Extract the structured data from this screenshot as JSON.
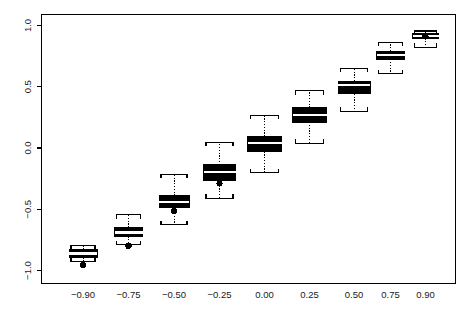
{
  "chart_data": {
    "type": "box",
    "title": "",
    "xlabel": "",
    "ylabel": "",
    "grid": false,
    "legend": null,
    "categories": [
      "-0.90",
      "-0.75",
      "-0.50",
      "-0.25",
      "0.00",
      "0.25",
      "0.50",
      "0.75",
      "0.90"
    ],
    "x_tick_labels": [
      "−0.90",
      "−0.75",
      "−0.50",
      "−0.25",
      "0.00",
      "0.25",
      "0.50",
      "0.75",
      "0.90"
    ],
    "y_tick_labels": [
      "1.0",
      "0.5",
      "0.0",
      "−0.5",
      "−1.0"
    ],
    "y_ticks": [
      1.0,
      0.5,
      0.0,
      -0.5,
      -1.0
    ],
    "ylim": [
      -1.1,
      1.1
    ],
    "box_fill": "#000000",
    "median_color": "#ffffff",
    "whisker_color": "#000000",
    "frame_color": "#000000",
    "boxes": [
      {
        "category": "-0.90",
        "whisker_low": -0.925,
        "q1": -0.893,
        "median": -0.862,
        "q3": -0.828,
        "whisker_high": -0.795,
        "outliers": [
          -0.955
        ]
      },
      {
        "category": "-0.75",
        "whisker_low": -0.79,
        "q1": -0.722,
        "median": -0.69,
        "q3": -0.648,
        "whisker_high": -0.545,
        "outliers": [
          -0.8
        ]
      },
      {
        "category": "-0.50",
        "whisker_low": -0.628,
        "q1": -0.485,
        "median": -0.438,
        "q3": -0.388,
        "whisker_high": -0.215,
        "outliers": [
          -0.515
        ]
      },
      {
        "category": "-0.25",
        "whisker_low": -0.412,
        "q1": -0.262,
        "median": -0.198,
        "q3": -0.138,
        "whisker_high": 0.048,
        "outliers": [
          -0.29
        ]
      },
      {
        "category": "0.00",
        "whisker_low": -0.2,
        "q1": -0.03,
        "median": 0.038,
        "q3": 0.095,
        "whisker_high": 0.268,
        "outliers": []
      },
      {
        "category": "0.25",
        "whisker_low": 0.04,
        "q1": 0.212,
        "median": 0.272,
        "q3": 0.33,
        "whisker_high": 0.468,
        "outliers": []
      },
      {
        "category": "0.50",
        "whisker_low": 0.298,
        "q1": 0.442,
        "median": 0.515,
        "q3": 0.545,
        "whisker_high": 0.65,
        "outliers": []
      },
      {
        "category": "0.75",
        "whisker_low": 0.608,
        "q1": 0.725,
        "median": 0.762,
        "q3": 0.79,
        "whisker_high": 0.862,
        "outliers": []
      },
      {
        "category": "0.90",
        "whisker_low": 0.822,
        "q1": 0.895,
        "median": 0.915,
        "q3": 0.935,
        "whisker_high": 0.955,
        "outliers": [
          0.912
        ]
      }
    ]
  }
}
